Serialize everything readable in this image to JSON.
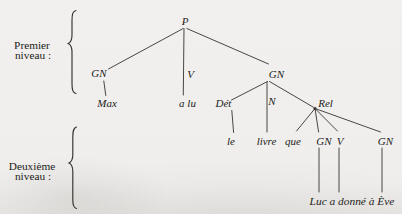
{
  "page": {
    "background_color": "#efeeec",
    "ink_color": "#35332f",
    "text_color": "#1d1c1a"
  },
  "level_labels": {
    "premier": {
      "line1": "Premier",
      "line2": "niveau :"
    },
    "deuxieme": {
      "line1": "Deuxième",
      "line2": "niveau :"
    }
  },
  "tree": {
    "root": "P",
    "gn_subject": "GN",
    "v_level1": "V",
    "gn_object": "GN",
    "terminal_max": "Max",
    "terminal_a_lu": "a lu",
    "det": "Dét",
    "noun": "N",
    "rel": "Rel",
    "terminal_le": "le",
    "terminal_livre": "livre",
    "terminal_que": "que",
    "gn_rel_subject": "GN",
    "v_rel": "V",
    "gn_rel_object": "GN",
    "terminal_phrase": "Luc a donné à Ève"
  }
}
